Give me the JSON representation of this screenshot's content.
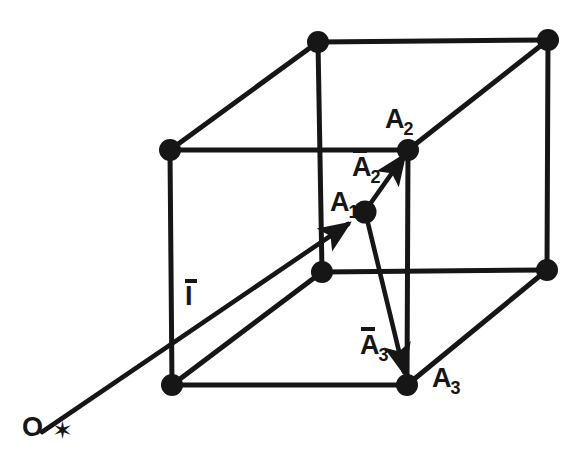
{
  "figure": {
    "background_color": "#ffffff",
    "ink_color": "#161616",
    "width": 582,
    "height": 465
  },
  "labels": {
    "origin": "O",
    "origin_marker": "✶",
    "point_a1_letter": "A",
    "point_a1_sub": "1",
    "point_a2_letter": "A",
    "point_a2_sub": "2",
    "point_a3_letter": "A",
    "point_a3_sub": "3",
    "vector_a2_letter": "A",
    "vector_a2_sub": "2",
    "vector_a3_letter": "A",
    "vector_a3_sub": "3",
    "vector_I_letter": "I"
  },
  "geometry": {
    "vertices": [
      {
        "name": "front-bottom-left",
        "x": 172,
        "y": 385
      },
      {
        "name": "front-top-left",
        "x": 170,
        "y": 150
      },
      {
        "name": "front-bottom-right",
        "x": 407,
        "y": 385
      },
      {
        "name": "front-top-right",
        "x": 408,
        "y": 150
      },
      {
        "name": "back-bottom-left",
        "x": 322,
        "y": 272
      },
      {
        "name": "back-top-left",
        "x": 318,
        "y": 42
      },
      {
        "name": "back-bottom-right",
        "x": 547,
        "y": 270
      },
      {
        "name": "back-top-right",
        "x": 548,
        "y": 40
      },
      {
        "name": "interior-point-A1",
        "x": 365,
        "y": 212
      }
    ],
    "edges": [
      {
        "from": "front-bottom-left",
        "to": "front-top-left"
      },
      {
        "from": "front-top-left",
        "to": "front-top-right"
      },
      {
        "from": "front-top-right",
        "to": "front-bottom-right"
      },
      {
        "from": "front-bottom-left",
        "to": "front-bottom-right"
      },
      {
        "from": "back-bottom-left",
        "to": "back-top-left"
      },
      {
        "from": "back-top-left",
        "to": "back-top-right"
      },
      {
        "from": "back-top-right",
        "to": "back-bottom-right"
      },
      {
        "from": "back-bottom-left",
        "to": "back-bottom-right"
      },
      {
        "from": "front-top-left",
        "to": "back-top-left"
      },
      {
        "from": "front-top-right",
        "to": "back-top-right"
      },
      {
        "from": "front-bottom-left",
        "to": "back-bottom-left"
      },
      {
        "from": "front-bottom-right",
        "to": "back-bottom-right"
      }
    ],
    "vectors": [
      {
        "name": "I",
        "from": [
          42,
          432
        ],
        "to": [
          365,
          212
        ],
        "label": "I"
      },
      {
        "name": "A2",
        "from": [
          365,
          212
        ],
        "to": [
          408,
          150
        ],
        "label": "A2"
      },
      {
        "name": "A3",
        "from": [
          365,
          212
        ],
        "to": [
          407,
          385
        ],
        "label": "A3"
      }
    ],
    "origin_point": {
      "x": 53,
      "y": 428
    }
  }
}
